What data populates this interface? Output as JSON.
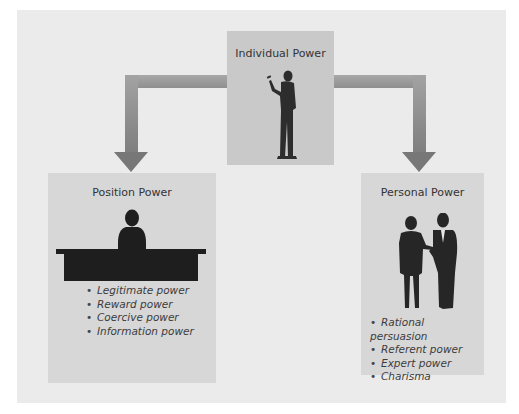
{
  "diagram": {
    "center": {
      "title": "Individual Power",
      "icon": "standing-person-pointing-icon"
    },
    "left": {
      "title": "Position Power",
      "icon": "person-behind-desk-icon",
      "items": [
        "Legitimate power",
        "Reward power",
        "Coercive power",
        "Information power"
      ]
    },
    "right": {
      "title": "Personal Power",
      "icon": "two-people-talking-icon",
      "items": [
        "Rational persuasion",
        "Referent power",
        "Expert power",
        "Charisma"
      ]
    },
    "colors": {
      "background": "#ffffff",
      "panel": "#ebebeb",
      "center_box": "#c9c9c9",
      "side_boxes": "#d7d7d7",
      "arrow": "#8f8f8f",
      "silhouette": "#2a2a2a"
    }
  }
}
